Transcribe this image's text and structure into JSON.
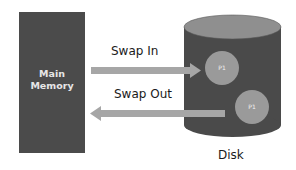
{
  "diagram": {
    "main_memory": {
      "label": "Main\nMemory"
    },
    "disk": {
      "label": "Disk"
    },
    "arrows": [
      {
        "label": "Swap In",
        "direction": "memory-to-disk"
      },
      {
        "label": "Swap Out",
        "direction": "disk-to-memory"
      }
    ],
    "processes": [
      {
        "label": "P1",
        "position": "upper"
      },
      {
        "label": "P1",
        "position": "lower"
      }
    ],
    "colors": {
      "memory_block": "#4b4b4b",
      "disk_body": "#4a4a4a",
      "disk_top": "#8f8f8f",
      "process_circle": "#9a9a9a",
      "arrow": "#a6a6a6"
    }
  }
}
